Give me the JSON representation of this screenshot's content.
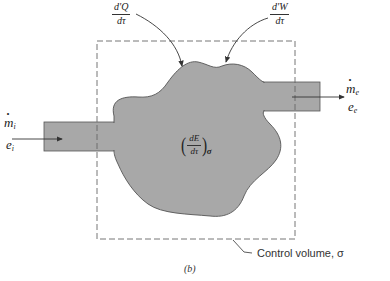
{
  "diagram": {
    "caption": "(b)",
    "control_volume_label": "Control volume, σ",
    "heat_rate": {
      "numerator": "d'Q",
      "denominator": "dτ"
    },
    "work_rate": {
      "numerator": "d'W",
      "denominator": "dτ"
    },
    "inlet": {
      "mass_flow": "m",
      "mass_flow_sub": "i",
      "energy": "e",
      "energy_sub": "i"
    },
    "exit": {
      "mass_flow": "m",
      "mass_flow_sub": "e",
      "energy": "e",
      "energy_sub": "e"
    },
    "energy_change": {
      "numerator": "dE",
      "denominator": "dτ",
      "subscript": "σ"
    },
    "colors": {
      "fill": "#a8a8a8",
      "stroke": "#555555",
      "dashed": "#666666",
      "background": "#ffffff"
    }
  }
}
